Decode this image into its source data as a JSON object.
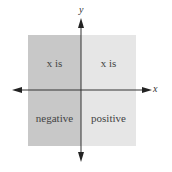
{
  "diagram": {
    "axes": {
      "x_label": "x",
      "y_label": "y"
    },
    "regions": [
      {
        "name": "left",
        "top_text": "x is",
        "bottom_text": "negative",
        "color": "#c8c8c8"
      },
      {
        "name": "right",
        "top_text": "x is",
        "bottom_text": "positive",
        "color": "#e6e6e6"
      }
    ]
  }
}
